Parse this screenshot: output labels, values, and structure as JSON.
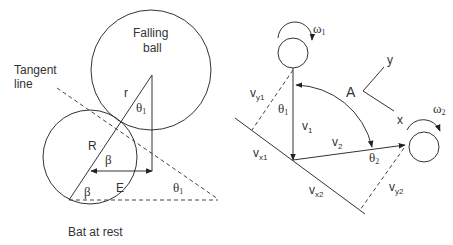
{
  "left_diagram": {
    "falling_ball_label_line1": "Falling",
    "falling_ball_label_line2": "ball",
    "tangent_label_line1": "Tangent",
    "tangent_label_line2": "line",
    "bat_label": "Bat at rest",
    "r_label": "r",
    "R_label": "R",
    "E_label": "E",
    "beta_upper": "β",
    "beta_lower": "β",
    "theta_ball": "θ",
    "theta_ball_sub": "1",
    "theta_tangent": "θ",
    "theta_tangent_sub": "1"
  },
  "right_diagram": {
    "omega1": "ω",
    "omega1_sub": "1",
    "omega2": "ω",
    "omega2_sub": "2",
    "axis_y": "y",
    "axis_x": "x",
    "A_label": "A",
    "theta1": "θ",
    "theta1_sub": "1",
    "theta2": "θ",
    "theta2_sub": "2",
    "v1": "v",
    "v1_sub": "1",
    "v2": "v",
    "v2_sub": "2",
    "vy1": "v",
    "vy1_sub": "y1",
    "vx1": "v",
    "vx1_sub": "x1",
    "vx2": "v",
    "vx2_sub": "x2",
    "vy2": "v",
    "vy2_sub": "y2"
  }
}
